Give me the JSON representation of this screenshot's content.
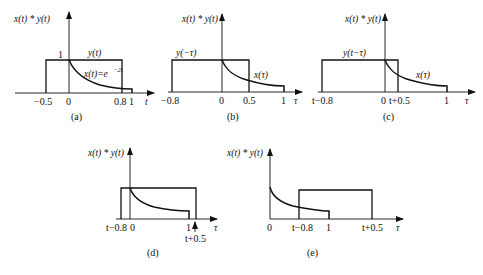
{
  "figure": {
    "y_axis_label": "x(t) * y(t)",
    "panels": [
      {
        "id": "a",
        "caption": "(a)",
        "x_axis_var": "t",
        "ticks": [
          "−0.5",
          "0",
          "0.8",
          "1"
        ],
        "height_label": "1",
        "rect_label": "y(t)",
        "curve_label": "x(t)=e",
        "curve_label_exp": "−2t"
      },
      {
        "id": "b",
        "caption": "(b)",
        "x_axis_var": "τ",
        "ticks": [
          "−0.8",
          "0",
          "0.5",
          "1"
        ],
        "rect_label": "y(−τ)",
        "curve_label": "x(τ)"
      },
      {
        "id": "c",
        "caption": "(c)",
        "x_axis_var": "τ",
        "ticks": [
          "t−0.8",
          "0",
          "t+0.5",
          "1"
        ],
        "rect_label": "y(t−τ)",
        "curve_label": "x(τ)"
      },
      {
        "id": "d",
        "caption": "(d)",
        "x_axis_var": "τ",
        "ticks": [
          "t−0.8",
          "0",
          "1",
          "t+0.5"
        ]
      },
      {
        "id": "e",
        "caption": "(e)",
        "x_axis_var": "τ",
        "ticks": [
          "0",
          "t−0.8",
          "1",
          "t+0.5"
        ]
      }
    ]
  }
}
